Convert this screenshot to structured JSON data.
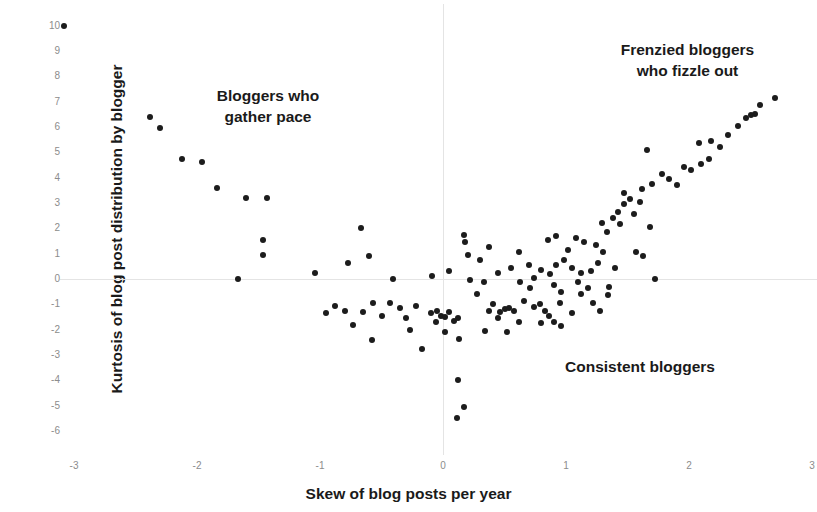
{
  "chart_data": {
    "type": "scatter",
    "title": "",
    "xlabel": "Skew of blog posts per year",
    "ylabel": "Kurtosis of blog post distribution by blogger",
    "xlim": [
      -3.15,
      3.05
    ],
    "ylim": [
      -6.2,
      10.25
    ],
    "xticks": [
      "-3",
      "-2",
      "-1",
      "0",
      "1",
      "2",
      "3"
    ],
    "xtick_values": [
      -3,
      -2,
      -1,
      0,
      1,
      2,
      3
    ],
    "yticks": [
      "10",
      "9",
      "8",
      "7",
      "6",
      "5",
      "4",
      "3",
      "2",
      "1",
      "0",
      "-1",
      "-2",
      "-3",
      "-4",
      "-5",
      "-6"
    ],
    "ytick_values": [
      10,
      9,
      8,
      7,
      6,
      5,
      4,
      3,
      2,
      1,
      0,
      -1,
      -2,
      -3,
      -4,
      -5,
      -6
    ],
    "grid": false,
    "zero_lines": true,
    "legend": "none",
    "marker_color": "#1c1c1c",
    "axis_color": "#e4e4e4",
    "tick_label_color": "#8c8c8c",
    "annotations": [
      {
        "id": "left",
        "text": "Bloggers who\ngather pace",
        "x": -1.85,
        "y": 6.0
      },
      {
        "id": "right",
        "text": "Frenzied bloggers\nwho fizzle out",
        "x": 2.1,
        "y": 8.4
      },
      {
        "id": "mid",
        "text": "Consistent bloggers",
        "x": 1.2,
        "y": -3.4
      }
    ],
    "points": [
      [
        -3.08,
        10.0
      ],
      [
        -2.38,
        6.4
      ],
      [
        -2.3,
        5.95
      ],
      [
        -2.12,
        4.75
      ],
      [
        -1.96,
        4.6
      ],
      [
        -1.84,
        3.6
      ],
      [
        -1.6,
        3.2
      ],
      [
        -1.43,
        3.2
      ],
      [
        -1.46,
        1.55
      ],
      [
        -1.46,
        0.95
      ],
      [
        -1.67,
        0.0
      ],
      [
        -1.04,
        0.25
      ],
      [
        -0.67,
        2.0
      ],
      [
        -0.77,
        0.65
      ],
      [
        -0.6,
        0.9
      ],
      [
        -0.41,
        0.0
      ],
      [
        -0.43,
        -0.95
      ],
      [
        -0.57,
        -0.95
      ],
      [
        -0.65,
        -1.3
      ],
      [
        -0.8,
        -1.25
      ],
      [
        -0.88,
        -1.05
      ],
      [
        -0.95,
        -1.35
      ],
      [
        -0.73,
        -1.8
      ],
      [
        -0.58,
        -2.4
      ],
      [
        -0.5,
        -1.45
      ],
      [
        -0.35,
        -1.15
      ],
      [
        -0.3,
        -1.55
      ],
      [
        -0.22,
        -1.05
      ],
      [
        -0.27,
        -2.0
      ],
      [
        -0.17,
        -2.75
      ],
      [
        -0.1,
        -1.35
      ],
      [
        -0.05,
        -1.25
      ],
      [
        -0.02,
        -1.45
      ],
      [
        -0.06,
        -1.7
      ],
      [
        0.02,
        -1.5
      ],
      [
        0.05,
        -1.3
      ],
      [
        0.09,
        -1.65
      ],
      [
        0.12,
        -1.55
      ],
      [
        0.02,
        -2.1
      ],
      [
        0.13,
        -2.35
      ],
      [
        -0.09,
        0.1
      ],
      [
        0.05,
        0.3
      ],
      [
        0.17,
        1.75
      ],
      [
        0.18,
        1.45
      ],
      [
        0.3,
        0.75
      ],
      [
        0.37,
        1.25
      ],
      [
        0.22,
        -0.05
      ],
      [
        0.33,
        -0.1
      ],
      [
        0.28,
        -0.6
      ],
      [
        0.41,
        -1.0
      ],
      [
        0.37,
        -1.25
      ],
      [
        0.46,
        -1.3
      ],
      [
        0.5,
        -1.2
      ],
      [
        0.54,
        -1.15
      ],
      [
        0.58,
        -1.25
      ],
      [
        0.45,
        -1.55
      ],
      [
        0.34,
        -2.05
      ],
      [
        0.52,
        -2.1
      ],
      [
        0.12,
        -4.0
      ],
      [
        0.17,
        -5.05
      ],
      [
        0.11,
        -5.5
      ],
      [
        0.62,
        1.05
      ],
      [
        0.7,
        0.55
      ],
      [
        0.63,
        -0.1
      ],
      [
        0.71,
        -0.35
      ],
      [
        0.66,
        -0.85
      ],
      [
        0.74,
        -1.1
      ],
      [
        0.79,
        -1.0
      ],
      [
        0.83,
        -1.25
      ],
      [
        0.86,
        -1.45
      ],
      [
        0.8,
        -1.75
      ],
      [
        0.9,
        -1.7
      ],
      [
        0.95,
        -0.95
      ],
      [
        0.96,
        -0.5
      ],
      [
        0.9,
        -0.25
      ],
      [
        0.87,
        0.2
      ],
      [
        0.92,
        0.55
      ],
      [
        0.98,
        0.75
      ],
      [
        1.02,
        1.15
      ],
      [
        0.85,
        1.55
      ],
      [
        0.92,
        1.7
      ],
      [
        1.08,
        1.6
      ],
      [
        1.15,
        1.45
      ],
      [
        1.05,
        0.45
      ],
      [
        1.12,
        0.25
      ],
      [
        1.1,
        -0.1
      ],
      [
        1.18,
        -0.35
      ],
      [
        1.22,
        -0.95
      ],
      [
        1.28,
        -1.25
      ],
      [
        1.2,
        0.3
      ],
      [
        1.26,
        0.65
      ],
      [
        1.3,
        1.05
      ],
      [
        1.24,
        1.35
      ],
      [
        1.33,
        1.85
      ],
      [
        1.29,
        2.2
      ],
      [
        1.38,
        2.4
      ],
      [
        1.44,
        2.15
      ],
      [
        1.42,
        2.65
      ],
      [
        1.47,
        2.95
      ],
      [
        1.52,
        3.15
      ],
      [
        1.47,
        3.4
      ],
      [
        1.55,
        2.55
      ],
      [
        1.6,
        3.05
      ],
      [
        1.57,
        1.05
      ],
      [
        1.63,
        0.9
      ],
      [
        1.68,
        2.05
      ],
      [
        1.72,
        0.0
      ],
      [
        1.62,
        3.55
      ],
      [
        1.7,
        3.75
      ],
      [
        1.66,
        5.1
      ],
      [
        1.78,
        4.15
      ],
      [
        1.84,
        3.95
      ],
      [
        1.9,
        3.7
      ],
      [
        1.96,
        4.4
      ],
      [
        2.02,
        4.3
      ],
      [
        2.1,
        4.55
      ],
      [
        2.16,
        4.75
      ],
      [
        2.08,
        5.35
      ],
      [
        2.18,
        5.45
      ],
      [
        2.25,
        5.2
      ],
      [
        2.32,
        5.7
      ],
      [
        2.4,
        6.05
      ],
      [
        2.46,
        6.35
      ],
      [
        2.5,
        6.45
      ],
      [
        2.54,
        6.5
      ],
      [
        2.58,
        6.85
      ],
      [
        2.7,
        7.15
      ],
      [
        1.4,
        0.45
      ],
      [
        1.35,
        -0.3
      ],
      [
        1.05,
        -1.35
      ],
      [
        0.96,
        -1.85
      ],
      [
        0.74,
        0.05
      ],
      [
        0.8,
        0.35
      ],
      [
        0.55,
        0.45
      ],
      [
        0.45,
        0.25
      ],
      [
        0.2,
        0.95
      ],
      [
        0.62,
        -1.7
      ],
      [
        1.12,
        -0.6
      ],
      [
        1.34,
        -0.65
      ]
    ]
  }
}
